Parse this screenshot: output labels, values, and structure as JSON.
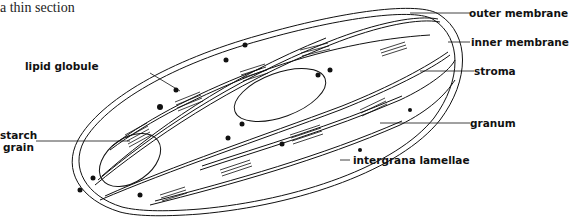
{
  "caption": "a thin section",
  "labels": {
    "outer_membrane": "outer membrane",
    "inner_membrane": "inner membrane",
    "stroma": "stroma",
    "granum": "granum",
    "intergrana_lamellae": "intergrana lamellae",
    "lipid_globule": "lipid globule",
    "starch_grain_line1": "starch",
    "starch_grain_line2": "grain"
  }
}
